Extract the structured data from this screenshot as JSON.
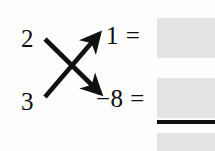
{
  "figure": {
    "type": "cross-multiplication-diagram",
    "background_color": "#fdfdfd",
    "ink_color": "#0d0d0d"
  },
  "operands": {
    "top": "2",
    "bottom": "3"
  },
  "arrows": [
    {
      "name": "arrow-up-right",
      "from": "bottom-left",
      "to": "top-right",
      "direction": "up-right",
      "color": "#111111"
    },
    {
      "name": "arrow-down-right",
      "from": "top-left",
      "to": "bottom-right",
      "direction": "down-right",
      "color": "#111111"
    }
  ],
  "expressions": {
    "top": "1 =",
    "bottom": "−8 ="
  },
  "redactions": [
    {
      "name": "redaction-product-1",
      "color": "#e3e3e3"
    },
    {
      "name": "redaction-product-2",
      "color": "#e3e3e3"
    },
    {
      "name": "redaction-sum-total",
      "color": "#e3e3e3"
    }
  ],
  "rule": {
    "name": "sum-rule",
    "color": "#111111"
  }
}
